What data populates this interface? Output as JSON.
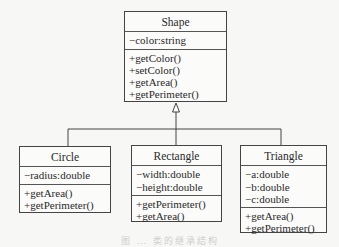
{
  "diagram": {
    "type": "uml-class-diagram",
    "relationship": "generalization",
    "parent": {
      "name": "Shape",
      "attributes": [
        "−color:string"
      ],
      "methods": [
        "+getColor()",
        "+setColor()",
        "+getArea()",
        "+getPerimeter()"
      ]
    },
    "children": [
      {
        "name": "Circle",
        "attributes": [
          "−radius:double"
        ],
        "methods": [
          "+getArea()",
          "+getPerimeter()"
        ]
      },
      {
        "name": "Rectangle",
        "attributes": [
          "−width:double",
          "−height:double"
        ],
        "methods": [
          "+getPerimeter()",
          "+getArea()"
        ]
      },
      {
        "name": "Triangle",
        "attributes": [
          "−a:double",
          "−b:double",
          "−c:double"
        ],
        "methods": [
          "+getArea()",
          "+getPerimeter()"
        ]
      }
    ],
    "caption": "图 … 类的继承结构"
  },
  "colors": {
    "line": "#444444",
    "background": "#f7f7f5",
    "text": "#2a2a2a"
  }
}
